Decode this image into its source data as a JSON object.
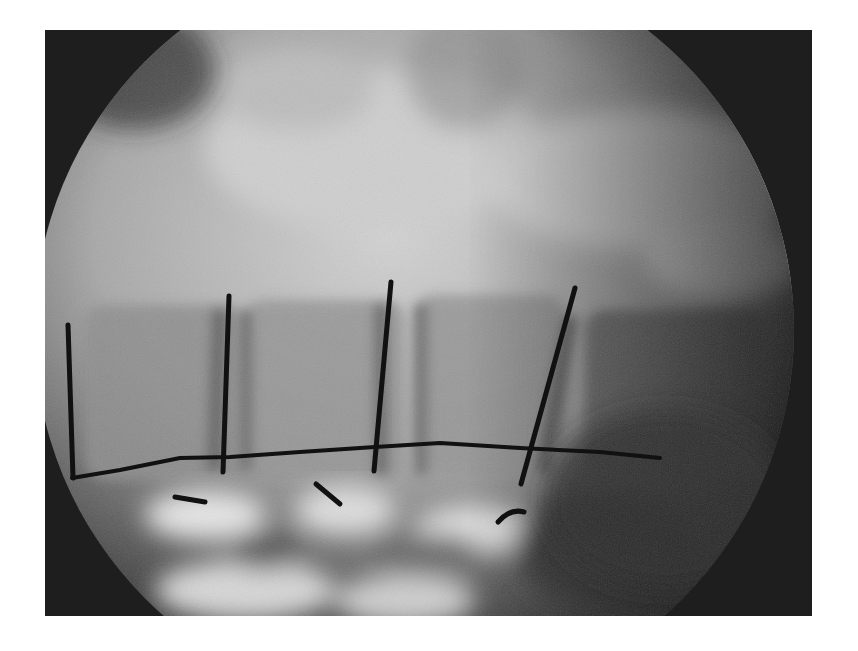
{
  "image": {
    "description": "Lateral fluoroscopic radiograph of spine with hand-drawn annotation lines",
    "frame": {
      "x": 45,
      "y": 30,
      "width": 767,
      "height": 586
    },
    "colors": {
      "page_background": "#ffffff",
      "frame_background": "#1c1c1c",
      "field_light": "#c9c9c9",
      "field_mid": "#9a9a9a",
      "field_dark": "#5a5a5a",
      "annotation_ink": "#111111"
    },
    "field_of_view": {
      "shape": "circle",
      "cx": 414,
      "cy": 330,
      "r": 380
    }
  },
  "annotations": {
    "baseline": {
      "description": "Wavy horizontal reference line across inferior endplates",
      "points": [
        [
          72,
          478
        ],
        [
          120,
          470
        ],
        [
          180,
          458
        ],
        [
          230,
          457
        ],
        [
          300,
          452
        ],
        [
          375,
          447
        ],
        [
          440,
          443
        ],
        [
          520,
          448
        ],
        [
          600,
          452
        ],
        [
          660,
          458
        ]
      ]
    },
    "vertical_lines": [
      {
        "x1": 68,
        "y1": 325,
        "x2": 73,
        "y2": 478
      },
      {
        "x1": 229,
        "y1": 296,
        "x2": 223,
        "y2": 472
      },
      {
        "x1": 391,
        "y1": 282,
        "x2": 374,
        "y2": 471
      },
      {
        "x1": 575,
        "y1": 288,
        "x2": 521,
        "y2": 484
      }
    ],
    "tick_marks": [
      {
        "type": "line",
        "x1": 175,
        "y1": 497,
        "x2": 205,
        "y2": 502
      },
      {
        "type": "line",
        "x1": 316,
        "y1": 484,
        "x2": 340,
        "y2": 504
      },
      {
        "type": "arc",
        "d": "M498 522 Q510 508 524 512"
      }
    ]
  }
}
